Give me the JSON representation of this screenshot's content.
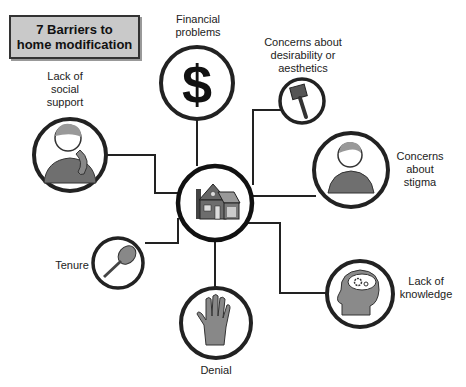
{
  "title": "7 Barriers to home modification",
  "title_lines": [
    "7 Barriers to",
    "home modification"
  ],
  "center": {
    "icon": "house-icon"
  },
  "barriers": [
    {
      "id": "financial",
      "label_lines": [
        "Financial",
        "problems"
      ],
      "icon": "dollar-icon"
    },
    {
      "id": "aesthetics",
      "label_lines": [
        "Concerns about",
        "desirability or",
        "aesthetics"
      ],
      "icon": "paintbrush-icon"
    },
    {
      "id": "social",
      "label_lines": [
        "Lack of",
        "social",
        "support"
      ],
      "icon": "person-phone-icon"
    },
    {
      "id": "stigma",
      "label_lines": [
        "Concerns",
        "about",
        "stigma"
      ],
      "icon": "person-icon"
    },
    {
      "id": "tenure",
      "label_lines": [
        "Tenure"
      ],
      "icon": "key-icon"
    },
    {
      "id": "knowledge",
      "label_lines": [
        "Lack of",
        "knowledge"
      ],
      "icon": "head-gears-icon"
    },
    {
      "id": "denial",
      "label_lines": [
        "Denial"
      ],
      "icon": "hand-icon"
    }
  ]
}
